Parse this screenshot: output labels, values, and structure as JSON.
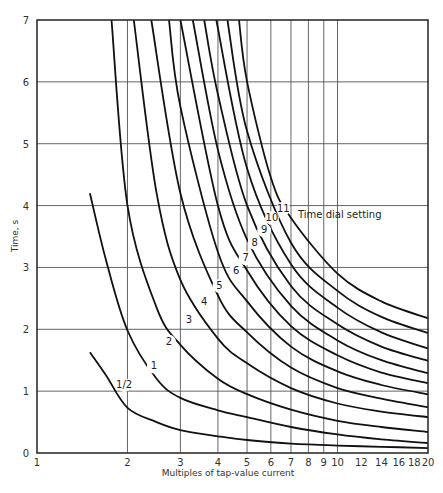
{
  "chart_data": {
    "type": "line",
    "title": "",
    "xlabel": "Multiples of tap-value current",
    "ylabel": "Time, s",
    "xscale": "log",
    "xlim": [
      1,
      20
    ],
    "ylim": [
      0,
      7
    ],
    "grid": true,
    "x_ticks": [
      1,
      2,
      3,
      4,
      5,
      6,
      7,
      8,
      9,
      10,
      12,
      14,
      16,
      18,
      20
    ],
    "x_gridlines": [
      2,
      3,
      4,
      5,
      6,
      7,
      8,
      9,
      10
    ],
    "y_ticks": [
      0,
      1,
      2,
      3,
      4,
      5,
      6,
      7
    ],
    "legend_title": "Time dial setting",
    "series": [
      {
        "name": "1/2",
        "label_at": [
          1.95,
          1.05
        ],
        "points": [
          [
            1.5,
            1.63
          ],
          [
            1.7,
            1.25
          ],
          [
            2,
            0.73
          ],
          [
            2.5,
            0.5
          ],
          [
            3,
            0.37
          ],
          [
            4,
            0.27
          ],
          [
            5,
            0.21
          ],
          [
            7,
            0.15
          ],
          [
            10,
            0.12
          ],
          [
            14,
            0.1
          ],
          [
            20,
            0.08
          ]
        ]
      },
      {
        "name": "1",
        "label_at": [
          2.45,
          1.35
        ],
        "points": [
          [
            1.5,
            4.2
          ],
          [
            1.7,
            3.1
          ],
          [
            2,
            1.98
          ],
          [
            2.5,
            1.2
          ],
          [
            3,
            0.89
          ],
          [
            4,
            0.69
          ],
          [
            5,
            0.58
          ],
          [
            7,
            0.42
          ],
          [
            10,
            0.3
          ],
          [
            14,
            0.22
          ],
          [
            20,
            0.16
          ]
        ]
      },
      {
        "name": "2",
        "label_at": [
          2.75,
          1.75
        ],
        "points": [
          [
            1.77,
            7
          ],
          [
            2,
            4.0
          ],
          [
            2.5,
            2.35
          ],
          [
            3,
            1.75
          ],
          [
            4,
            1.2
          ],
          [
            5,
            0.95
          ],
          [
            7,
            0.7
          ],
          [
            10,
            0.52
          ],
          [
            14,
            0.42
          ],
          [
            20,
            0.34
          ]
        ]
      },
      {
        "name": "3",
        "label_at": [
          3.2,
          2.1
        ],
        "points": [
          [
            2.1,
            7
          ],
          [
            2.5,
            4.2
          ],
          [
            3,
            2.8
          ],
          [
            4,
            1.85
          ],
          [
            5,
            1.45
          ],
          [
            7,
            1.05
          ],
          [
            10,
            0.8
          ],
          [
            14,
            0.67
          ],
          [
            20,
            0.58
          ]
        ]
      },
      {
        "name": "4",
        "label_at": [
          3.6,
          2.4
        ],
        "points": [
          [
            2.4,
            7
          ],
          [
            3,
            4.2
          ],
          [
            4,
            2.55
          ],
          [
            5,
            1.95
          ],
          [
            7,
            1.38
          ],
          [
            10,
            1.05
          ],
          [
            14,
            0.88
          ],
          [
            20,
            0.74
          ]
        ]
      },
      {
        "name": "5",
        "label_at": [
          4.05,
          2.65
        ],
        "points": [
          [
            2.75,
            7
          ],
          [
            3,
            5.6
          ],
          [
            4,
            3.25
          ],
          [
            5,
            2.45
          ],
          [
            7,
            1.72
          ],
          [
            10,
            1.32
          ],
          [
            14,
            1.1
          ],
          [
            20,
            0.95
          ]
        ]
      },
      {
        "name": "6",
        "label_at": [
          4.6,
          2.9
        ],
        "points": [
          [
            3.0,
            7
          ],
          [
            4,
            4.0
          ],
          [
            5,
            2.95
          ],
          [
            7,
            2.05
          ],
          [
            10,
            1.58
          ],
          [
            14,
            1.3
          ],
          [
            20,
            1.13
          ]
        ]
      },
      {
        "name": "7",
        "label_at": [
          4.95,
          3.1
        ],
        "points": [
          [
            3.3,
            7
          ],
          [
            4,
            4.9
          ],
          [
            5,
            3.45
          ],
          [
            7,
            2.38
          ],
          [
            10,
            1.82
          ],
          [
            14,
            1.5
          ],
          [
            20,
            1.29
          ]
        ]
      },
      {
        "name": "8",
        "label_at": [
          5.3,
          3.35
        ],
        "points": [
          [
            3.6,
            7
          ],
          [
            4,
            5.8
          ],
          [
            5,
            4.0
          ],
          [
            7,
            2.7
          ],
          [
            10,
            2.08
          ],
          [
            14,
            1.72
          ],
          [
            20,
            1.49
          ]
        ]
      },
      {
        "name": "9",
        "label_at": [
          5.7,
          3.55
        ],
        "points": [
          [
            3.95,
            7
          ],
          [
            5,
            4.6
          ],
          [
            7,
            3.05
          ],
          [
            10,
            2.35
          ],
          [
            14,
            1.95
          ],
          [
            20,
            1.69
          ]
        ]
      },
      {
        "name": "10",
        "label_at": [
          6.05,
          3.75
        ],
        "points": [
          [
            4.3,
            7
          ],
          [
            5,
            5.2
          ],
          [
            7,
            3.4
          ],
          [
            10,
            2.62
          ],
          [
            14,
            2.2
          ],
          [
            20,
            1.94
          ]
        ]
      },
      {
        "name": "11",
        "label_at": [
          6.6,
          3.9
        ],
        "points": [
          [
            4.7,
            7
          ],
          [
            5,
            6.0
          ],
          [
            6,
            4.45
          ],
          [
            7,
            3.8
          ],
          [
            10,
            2.9
          ],
          [
            14,
            2.45
          ],
          [
            20,
            2.18
          ]
        ]
      }
    ]
  }
}
